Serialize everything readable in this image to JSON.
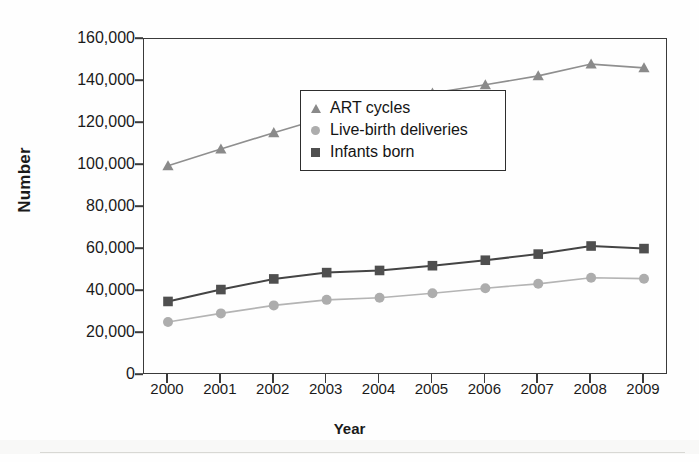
{
  "chart_data": {
    "type": "line",
    "title": "",
    "xlabel": "Year",
    "ylabel": "Number",
    "categories": [
      "2000",
      "2001",
      "2002",
      "2003",
      "2004",
      "2005",
      "2006",
      "2007",
      "2008",
      "2009"
    ],
    "x": [
      2000,
      2001,
      2002,
      2003,
      2004,
      2005,
      2006,
      2007,
      2008,
      2009
    ],
    "ylim": [
      0,
      160000
    ],
    "xlim": [
      2000,
      2009
    ],
    "grid": false,
    "legend_position": "center-right-inside",
    "y_ticks": [
      0,
      20000,
      40000,
      60000,
      80000,
      100000,
      120000,
      140000,
      160000
    ],
    "y_tick_labels": [
      "0",
      "20,000",
      "40,000",
      "60,000",
      "80,000",
      "100,000",
      "120,000",
      "140,000",
      "160,000"
    ],
    "x_tick_labels": [
      "2000",
      "2001",
      "2002",
      "2003",
      "2004",
      "2005",
      "2006",
      "2007",
      "2008",
      "2009"
    ],
    "series": [
      {
        "name": "ART cycles",
        "marker": "triangle",
        "color": "#8a8a8a",
        "line_color": "#8f8f8f",
        "values": [
          99629,
          107587,
          115392,
          122872,
          127977,
          134260,
          138198,
          142435,
          148055,
          146244
        ]
      },
      {
        "name": "Live-birth deliveries",
        "marker": "circle",
        "color": "#adadad",
        "line_color": "#b4b4b4",
        "values": [
          25228,
          29344,
          33141,
          35785,
          36760,
          38910,
          41343,
          43412,
          46326,
          45870
        ]
      },
      {
        "name": "Infants born",
        "marker": "square",
        "color": "#4f4f4f",
        "line_color": "#444444",
        "values": [
          35025,
          40687,
          45751,
          48756,
          49782,
          52041,
          54656,
          57569,
          61426,
          60190
        ]
      }
    ]
  },
  "axis": {
    "y_title": "Number",
    "x_title": "Year"
  },
  "legend": {
    "items": [
      {
        "label": "ART cycles",
        "marker": "triangle-marker"
      },
      {
        "label": "Live-birth deliveries",
        "marker": "circle-marker"
      },
      {
        "label": "Infants born",
        "marker": "square-marker"
      }
    ]
  },
  "colors": {
    "frame": "#3a3a3a",
    "text": "#1a1a1a",
    "background": "#ffffff",
    "art_cycles": "#8a8a8a",
    "live_birth_deliveries": "#adadad",
    "infants_born": "#4f4f4f"
  }
}
